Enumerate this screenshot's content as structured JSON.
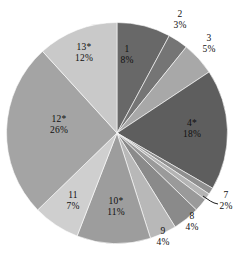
{
  "chart_data": {
    "type": "pie",
    "title": "",
    "subtitle": "",
    "xlabel": "",
    "ylabel": "",
    "legend_position": "none",
    "grid": false,
    "start_angle_deg": 0,
    "direction": "clockwise",
    "categories": [
      "1",
      "2",
      "3",
      "4*",
      "5",
      "6",
      "7",
      "8",
      "9",
      "10*",
      "11",
      "12*",
      "13*"
    ],
    "values": [
      8,
      3,
      5,
      18,
      1,
      1,
      2,
      4,
      4,
      11,
      7,
      26,
      12
    ],
    "value_labels": [
      "8%",
      "3%",
      "5%",
      "18%",
      "",
      "",
      "2%",
      "4%",
      "4%",
      "11%",
      "7%",
      "26%",
      "12%"
    ],
    "colors": [
      "#686868",
      "#757575",
      "#a8a8a8",
      "#5e5e5e",
      "#8f8f8f",
      "#b4b4b4",
      "#9a9a9a",
      "#8a8a8a",
      "#b8b8b8",
      "#9d9d9d",
      "#cfcfcf",
      "#a4a4a4",
      "#c9c9c9"
    ],
    "slices": [
      {
        "name": "1",
        "value": 8,
        "value_label": "8%",
        "color": "#686868",
        "label_placement": "inside"
      },
      {
        "name": "2",
        "value": 3,
        "value_label": "3%",
        "color": "#757575",
        "label_placement": "outside"
      },
      {
        "name": "3",
        "value": 5,
        "value_label": "5%",
        "color": "#a8a8a8",
        "label_placement": "outside"
      },
      {
        "name": "4*",
        "value": 18,
        "value_label": "18%",
        "color": "#5e5e5e",
        "label_placement": "inside"
      },
      {
        "name": "5",
        "value": 1,
        "value_label": "",
        "color": "#8f8f8f",
        "label_placement": "none"
      },
      {
        "name": "6",
        "value": 1,
        "value_label": "",
        "color": "#b4b4b4",
        "label_placement": "none"
      },
      {
        "name": "7",
        "value": 2,
        "value_label": "2%",
        "color": "#9a9a9a",
        "label_placement": "outside-leader"
      },
      {
        "name": "8",
        "value": 4,
        "value_label": "4%",
        "color": "#8a8a8a",
        "label_placement": "outside"
      },
      {
        "name": "9",
        "value": 4,
        "value_label": "4%",
        "color": "#b8b8b8",
        "label_placement": "outside"
      },
      {
        "name": "10*",
        "value": 11,
        "value_label": "11%",
        "color": "#9d9d9d",
        "label_placement": "inside"
      },
      {
        "name": "11",
        "value": 7,
        "value_label": "7%",
        "color": "#cfcfcf",
        "label_placement": "inside"
      },
      {
        "name": "12*",
        "value": 26,
        "value_label": "26%",
        "color": "#a4a4a4",
        "label_placement": "inside"
      },
      {
        "name": "13*",
        "value": 12,
        "value_label": "12%",
        "color": "#c9c9c9",
        "label_placement": "inside"
      }
    ]
  },
  "labels": {
    "s1": {
      "name": "1",
      "value": "8%"
    },
    "s2": {
      "name": "2",
      "value": "3%"
    },
    "s3": {
      "name": "3",
      "value": "5%"
    },
    "s4": {
      "name": "4*",
      "value": "18%"
    },
    "s7": {
      "name": "7",
      "value": "2%"
    },
    "s8": {
      "name": "8",
      "value": "4%"
    },
    "s9": {
      "name": "9",
      "value": "4%"
    },
    "s10": {
      "name": "10*",
      "value": "11%"
    },
    "s11": {
      "name": "11",
      "value": "7%"
    },
    "s12": {
      "name": "12*",
      "value": "26%"
    },
    "s13": {
      "name": "13*",
      "value": "12%"
    }
  }
}
